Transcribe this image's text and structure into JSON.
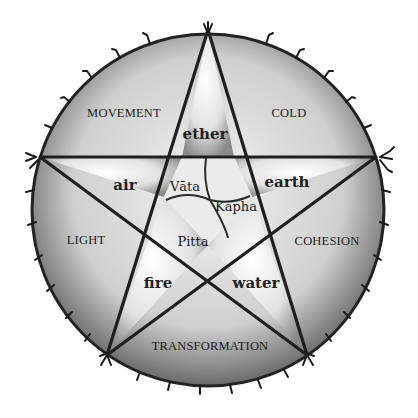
{
  "diagram": {
    "title": "",
    "type": "pentagram-in-circle",
    "colors": {
      "background": "#ffffff",
      "ink": "#1c1c1c",
      "shade_dark": "#6e6e6e",
      "shade_light": "#f2f2f2"
    },
    "outer_qualities": {
      "top_left": "MOVEMENT",
      "top_right": "COLD",
      "left": "LIGHT",
      "right": "COHESION",
      "bottom": "TRANSFORMATION"
    },
    "elements": {
      "top": "ether",
      "left": "air",
      "right": "earth",
      "bottom_left": "fire",
      "bottom_right": "water"
    },
    "doshas": {
      "vata": "Vāta",
      "kapha": "Kapha",
      "pitta": "Pitta"
    }
  }
}
